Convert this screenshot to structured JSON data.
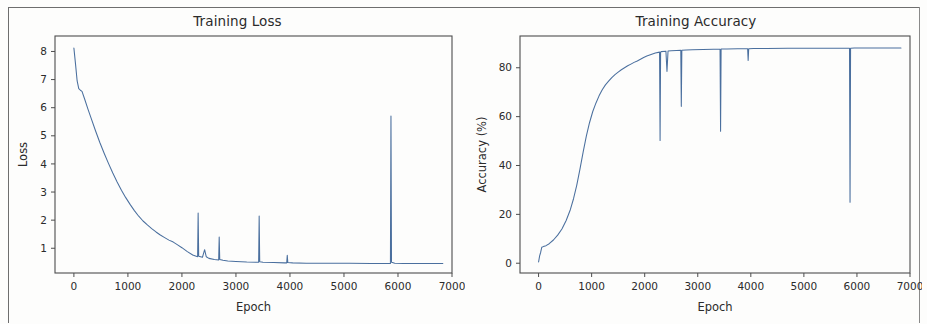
{
  "figure": {
    "panels": [
      {
        "id": "training-loss",
        "title": "Training Loss",
        "xlabel": "Epoch",
        "ylabel": "Loss"
      },
      {
        "id": "training-accuracy",
        "title": "Training Accuracy",
        "xlabel": "Epoch",
        "ylabel": "Accuracy (%)"
      }
    ]
  },
  "style": {
    "line_color": "#4a6f9e",
    "axis_color": "#4d4d4d",
    "text_color": "#2b2b2b",
    "background": "#ffffff"
  },
  "chart_data": [
    {
      "type": "line",
      "title": "Training Loss",
      "xlabel": "Epoch",
      "ylabel": "Loss",
      "xlim": [
        -350,
        7000
      ],
      "ylim": [
        0.12,
        8.55
      ],
      "xticks": [
        0,
        1000,
        2000,
        3000,
        4000,
        5000,
        6000,
        7000
      ],
      "xtick_labels": [
        "0",
        "1000",
        "2000",
        "3000",
        "4000",
        "5000",
        "6000",
        "7000"
      ],
      "yticks": [
        1,
        2,
        3,
        4,
        5,
        6,
        7,
        8
      ],
      "ytick_labels": [
        "1",
        "2",
        "3",
        "4",
        "5",
        "6",
        "7",
        "8"
      ],
      "grid": false,
      "legend": null,
      "series": [
        {
          "name": "loss",
          "color": "#4a6f9e",
          "x": [
            0,
            30,
            60,
            90,
            120,
            150,
            200,
            260,
            320,
            400,
            480,
            560,
            640,
            720,
            800,
            880,
            960,
            1040,
            1120,
            1200,
            1280,
            1360,
            1440,
            1520,
            1600,
            1680,
            1760,
            1840,
            1920,
            2000,
            2100,
            2200,
            2290,
            2300,
            2310,
            2380,
            2420,
            2450,
            2500,
            2600,
            2680,
            2690,
            2700,
            2760,
            2850,
            3000,
            3200,
            3400,
            3420,
            3430,
            3440,
            3500,
            3700,
            3900,
            3940,
            3950,
            3960,
            4050,
            4300,
            4700,
            5100,
            5500,
            5800,
            5860,
            5870,
            5880,
            5940,
            6100,
            6400,
            6700,
            6830
          ],
          "y": [
            8.12,
            7.55,
            6.95,
            6.68,
            6.62,
            6.58,
            6.3,
            5.95,
            5.62,
            5.18,
            4.76,
            4.38,
            4.02,
            3.68,
            3.36,
            3.06,
            2.8,
            2.56,
            2.34,
            2.14,
            1.97,
            1.83,
            1.7,
            1.58,
            1.47,
            1.38,
            1.29,
            1.22,
            1.12,
            1.02,
            0.88,
            0.76,
            0.7,
            2.25,
            0.72,
            0.68,
            0.95,
            0.7,
            0.64,
            0.6,
            0.58,
            1.4,
            0.6,
            0.57,
            0.55,
            0.53,
            0.51,
            0.5,
            0.5,
            2.15,
            0.52,
            0.5,
            0.49,
            0.48,
            0.48,
            0.75,
            0.49,
            0.48,
            0.47,
            0.47,
            0.47,
            0.46,
            0.46,
            0.46,
            5.7,
            0.5,
            0.47,
            0.46,
            0.46,
            0.46,
            0.46
          ]
        }
      ],
      "annotations": {
        "initial_loss": 8.12,
        "final_loss": 0.46,
        "spikes": [
          {
            "epoch": 2300,
            "value": 2.25
          },
          {
            "epoch": 2690,
            "value": 1.4
          },
          {
            "epoch": 3430,
            "value": 2.15
          },
          {
            "epoch": 3950,
            "value": 0.75
          },
          {
            "epoch": 5870,
            "value": 5.7
          }
        ]
      }
    },
    {
      "type": "line",
      "title": "Training Accuracy",
      "xlabel": "Epoch",
      "ylabel": "Accuracy (%)",
      "xlim": [
        -350,
        7000
      ],
      "ylim": [
        -4,
        93
      ],
      "xticks": [
        0,
        1000,
        2000,
        3000,
        4000,
        5000,
        6000,
        7000
      ],
      "xtick_labels": [
        "0",
        "1000",
        "2000",
        "3000",
        "4000",
        "5000",
        "6000",
        "7000"
      ],
      "yticks": [
        0,
        20,
        40,
        60,
        80
      ],
      "ytick_labels": [
        "0",
        "20",
        "40",
        "60",
        "80"
      ],
      "grid": false,
      "legend": null,
      "series": [
        {
          "name": "accuracy",
          "color": "#4a6f9e",
          "x": [
            0,
            20,
            40,
            60,
            90,
            140,
            200,
            280,
            360,
            440,
            520,
            600,
            660,
            720,
            780,
            840,
            900,
            960,
            1020,
            1080,
            1140,
            1200,
            1260,
            1320,
            1380,
            1440,
            1500,
            1560,
            1620,
            1680,
            1740,
            1800,
            1860,
            1920,
            1980,
            2040,
            2120,
            2200,
            2280,
            2290,
            2300,
            2310,
            2400,
            2420,
            2440,
            2500,
            2600,
            2680,
            2690,
            2700,
            2780,
            2900,
            3100,
            3300,
            3420,
            3430,
            3440,
            3550,
            3750,
            3940,
            3950,
            3960,
            4050,
            4300,
            4700,
            5100,
            5500,
            5800,
            5860,
            5870,
            5880,
            5950,
            6100,
            6400,
            6700,
            6830
          ],
          "y": [
            0.5,
            3.0,
            4.5,
            6.5,
            6.8,
            7.2,
            8.0,
            9.5,
            11.5,
            14.0,
            17.5,
            22.0,
            26.5,
            32.0,
            38.5,
            45.5,
            52.0,
            57.5,
            62.0,
            65.5,
            68.5,
            71.0,
            73.0,
            74.5,
            76.0,
            77.2,
            78.2,
            79.2,
            80.0,
            80.8,
            81.5,
            82.2,
            82.8,
            83.5,
            84.2,
            84.8,
            85.4,
            86.0,
            86.4,
            50.2,
            86.5,
            86.6,
            86.8,
            78.5,
            86.9,
            87.0,
            87.1,
            87.2,
            64.2,
            87.2,
            87.3,
            87.4,
            87.5,
            87.6,
            87.6,
            54.0,
            87.7,
            87.7,
            87.8,
            87.8,
            83.0,
            87.8,
            87.9,
            87.9,
            88.0,
            88.0,
            88.0,
            88.0,
            88.0,
            25.0,
            88.0,
            88.1,
            88.1,
            88.1,
            88.1,
            88.1
          ]
        }
      ],
      "annotations": {
        "initial_accuracy": 0.5,
        "final_accuracy": 88.1,
        "dips": [
          {
            "epoch": 2290,
            "value": 50.2
          },
          {
            "epoch": 2420,
            "value": 78.5
          },
          {
            "epoch": 2690,
            "value": 64.2
          },
          {
            "epoch": 3430,
            "value": 54.0
          },
          {
            "epoch": 3950,
            "value": 83.0
          },
          {
            "epoch": 5870,
            "value": 25.0
          }
        ]
      }
    }
  ]
}
